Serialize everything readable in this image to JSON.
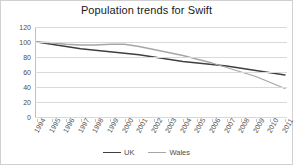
{
  "chart_data": {
    "type": "line",
    "title": "Population trends for Swift",
    "xlabel": "",
    "ylabel": "",
    "grid": true,
    "legend_position": "bottom",
    "ylim": [
      0,
      120
    ],
    "yticks": [
      0,
      20,
      40,
      60,
      80,
      100,
      120
    ],
    "categories": [
      "1994",
      "1995",
      "1996",
      "1997",
      "1998",
      "1999",
      "2000",
      "2001",
      "2002",
      "2003",
      "2004",
      "2005",
      "2006",
      "2007",
      "2008",
      "2009",
      "2010",
      "2011"
    ],
    "series": [
      {
        "name": "UK",
        "color": "#3f3f3f",
        "values": [
          100,
          97,
          94,
          91,
          89,
          87,
          85,
          83,
          80,
          77,
          74,
          72,
          70,
          68,
          65,
          62,
          59,
          56
        ]
      },
      {
        "name": "Wales",
        "color": "#a6a6a6",
        "values": [
          100,
          99,
          97,
          96,
          96,
          97,
          97,
          94,
          90,
          86,
          82,
          77,
          72,
          66,
          60,
          54,
          46,
          38
        ]
      }
    ]
  },
  "legend": {
    "items": [
      {
        "label": "UK"
      },
      {
        "label": "Wales"
      }
    ]
  },
  "colors": {
    "uk_line": "#3f3f3f",
    "wales_line": "#a6a6a6",
    "gridline": "#d9d9d9",
    "border": "#d0d0d0",
    "text": "#4d4d4d",
    "title": "#1a1a1a"
  }
}
